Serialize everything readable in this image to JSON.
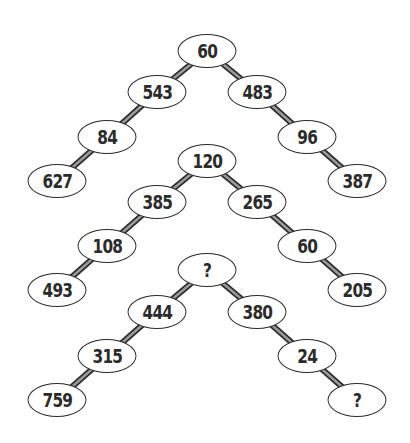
{
  "puzzle": {
    "description": "Number tree puzzle with three trees; find the missing values",
    "trees": [
      {
        "nodes": [
          {
            "id": "t1-top",
            "label": "60",
            "x": 207,
            "y": 51
          },
          {
            "id": "t1-l1",
            "label": "543",
            "x": 157,
            "y": 92
          },
          {
            "id": "t1-r1",
            "label": "483",
            "x": 257,
            "y": 92
          },
          {
            "id": "t1-l2",
            "label": "84",
            "x": 107,
            "y": 137
          },
          {
            "id": "t1-r2",
            "label": "96",
            "x": 307,
            "y": 137
          },
          {
            "id": "t1-l3",
            "label": "627",
            "x": 57,
            "y": 181
          },
          {
            "id": "t1-r3",
            "label": "387",
            "x": 357,
            "y": 181
          }
        ]
      },
      {
        "nodes": [
          {
            "id": "t2-top",
            "label": "120",
            "x": 207,
            "y": 161
          },
          {
            "id": "t2-l1",
            "label": "385",
            "x": 157,
            "y": 202
          },
          {
            "id": "t2-r1",
            "label": "265",
            "x": 257,
            "y": 202
          },
          {
            "id": "t2-l2",
            "label": "108",
            "x": 107,
            "y": 246
          },
          {
            "id": "t2-r2",
            "label": "60",
            "x": 307,
            "y": 246
          },
          {
            "id": "t2-l3",
            "label": "493",
            "x": 57,
            "y": 290
          },
          {
            "id": "t2-r3",
            "label": "205",
            "x": 357,
            "y": 290
          }
        ]
      },
      {
        "nodes": [
          {
            "id": "t3-top",
            "label": "?",
            "x": 207,
            "y": 270
          },
          {
            "id": "t3-l1",
            "label": "444",
            "x": 157,
            "y": 312
          },
          {
            "id": "t3-r1",
            "label": "380",
            "x": 257,
            "y": 312
          },
          {
            "id": "t3-l2",
            "label": "315",
            "x": 107,
            "y": 356
          },
          {
            "id": "t3-r2",
            "label": "24",
            "x": 307,
            "y": 356
          },
          {
            "id": "t3-l3",
            "label": "759",
            "x": 57,
            "y": 400
          },
          {
            "id": "t3-r3",
            "label": "?",
            "x": 357,
            "y": 400
          }
        ]
      }
    ],
    "colors": {
      "stroke": "#2a2a2a",
      "connector_fill": "#9a9a9a",
      "text": "#2b2b2b",
      "background": "#ffffff"
    }
  }
}
